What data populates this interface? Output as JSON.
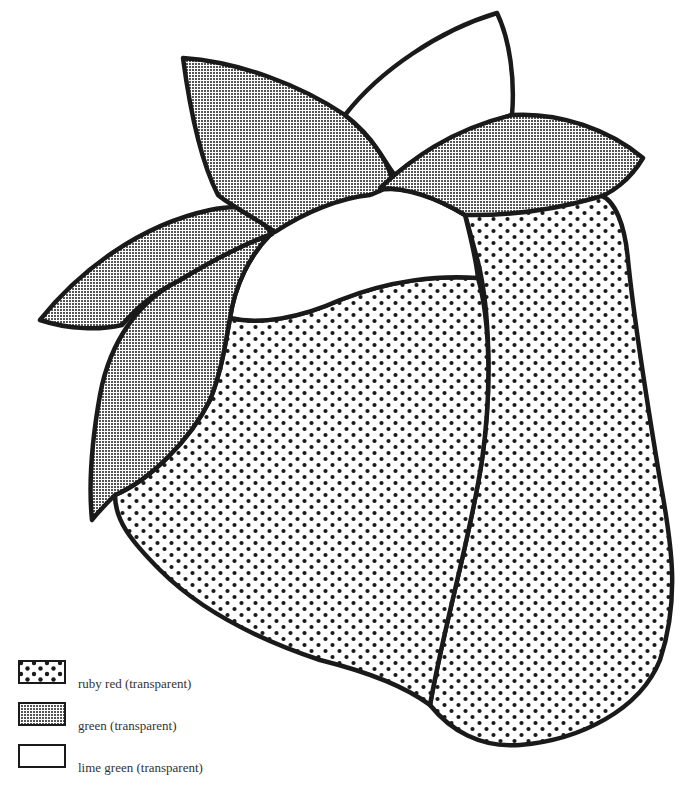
{
  "figure": {
    "type": "stained-glass pattern",
    "stroke_color": "#1a1a1a",
    "regions": [
      {
        "id": "leaf-top",
        "material": "lime green (transparent)",
        "fill": "lime"
      },
      {
        "id": "leaf-upper-left",
        "material": "green (transparent)",
        "fill": "green"
      },
      {
        "id": "leaf-right",
        "material": "green (transparent)",
        "fill": "green"
      },
      {
        "id": "leaf-far-left",
        "material": "green (transparent)",
        "fill": "green"
      },
      {
        "id": "leaf-lower-left",
        "material": "green (transparent)",
        "fill": "green"
      },
      {
        "id": "center-calyx",
        "material": "lime green (transparent)",
        "fill": "lime"
      },
      {
        "id": "berry-left",
        "material": "ruby red (transparent)",
        "fill": "ruby"
      },
      {
        "id": "berry-right",
        "material": "ruby red (transparent)",
        "fill": "ruby"
      }
    ]
  },
  "legend": {
    "items": [
      {
        "label": "ruby red (transparent)",
        "pattern": "ruby"
      },
      {
        "label": "green (transparent)",
        "pattern": "green"
      },
      {
        "label": "lime green (transparent)",
        "pattern": "lime"
      }
    ]
  }
}
